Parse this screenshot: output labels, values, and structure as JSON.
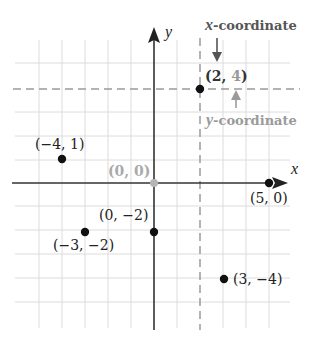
{
  "diagram": {
    "type": "coordinate-plane",
    "axes": {
      "x_label": "x",
      "y_label": "y"
    },
    "origin_label": "(0, 0)",
    "grid": {
      "x_min": -5,
      "x_max": 5,
      "y_min": -6,
      "y_max": 6
    },
    "points": [
      {
        "x": 2,
        "y": 4,
        "label_open": "(",
        "label_x": "2",
        "label_sep": ", ",
        "label_y": "4",
        "label_close": ")"
      },
      {
        "x": -4,
        "y": 1,
        "label": "(−4, 1)"
      },
      {
        "x": 5,
        "y": 0,
        "label": "(5, 0)"
      },
      {
        "x": 0,
        "y": -2,
        "label": "(0, −2)"
      },
      {
        "x": -3,
        "y": -2,
        "label": "(−3, −2)"
      },
      {
        "x": 3,
        "y": -4,
        "label": "(3, −4)"
      }
    ],
    "callouts": {
      "x_coordinate": {
        "var": "x",
        "text": "-coordinate",
        "color": "#555555"
      },
      "y_coordinate": {
        "var": "y",
        "text": "-coordinate",
        "color": "#9a9a9a"
      }
    },
    "colors": {
      "grid": "#dddddd",
      "axis": "#333333",
      "point": "#111111",
      "origin": "#b5b5b5",
      "dashed": "#999999"
    }
  }
}
